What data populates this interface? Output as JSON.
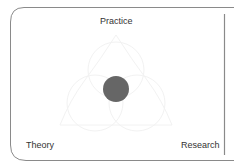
{
  "diagram": {
    "labels": {
      "top": "Practice",
      "bottom_left": "Theory",
      "bottom_right": "Research"
    },
    "center_dot_color": "#666666",
    "frame_color": "#8a8a8a",
    "background_shape_color": "#f4f4f4"
  }
}
